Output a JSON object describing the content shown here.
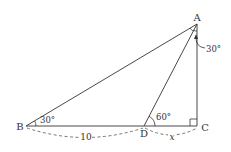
{
  "diagram": {
    "points": {
      "A": {
        "label": "A",
        "x": 197,
        "y": 24
      },
      "B": {
        "label": "B",
        "x": 26,
        "y": 126
      },
      "C": {
        "label": "C",
        "x": 198,
        "y": 126
      },
      "D": {
        "label": "D",
        "x": 144,
        "y": 126
      }
    },
    "angles": {
      "B": "30°",
      "ADC": "60°",
      "DAC": "30°"
    },
    "lengths": {
      "BD": "10",
      "DC": "x"
    },
    "colors": {
      "stroke": "#333333",
      "dashed": "#555555"
    }
  }
}
